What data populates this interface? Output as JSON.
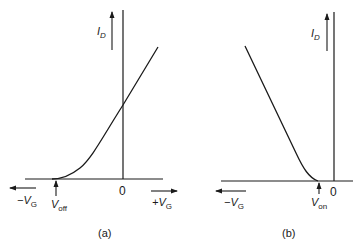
{
  "figure": {
    "panel_a": {
      "caption": "(a)",
      "y_axis_label": "I",
      "y_axis_sub": "D",
      "origin_label": "0",
      "neg_x_label": "−V",
      "neg_x_sub": "G",
      "pos_x_label": "+V",
      "pos_x_sub": "G",
      "threshold_label": "V",
      "threshold_sub": "off"
    },
    "panel_b": {
      "caption": "(b)",
      "y_axis_label": "I",
      "y_axis_sub": "D",
      "origin_label": "0",
      "neg_x_label": "−V",
      "neg_x_sub": "G",
      "threshold_label": "V",
      "threshold_sub": "on"
    },
    "colors": {
      "ink": "#1a1a1a",
      "background": "#ffffff"
    }
  }
}
